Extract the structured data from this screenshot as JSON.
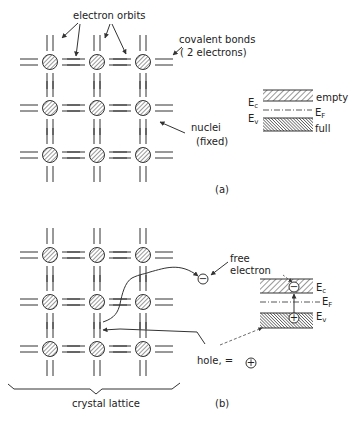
{
  "figure": {
    "panel_a": {
      "caption": "(a)",
      "labels": {
        "electron_orbits": "electron orbits",
        "covalent_bonds_line1": "covalent bonds",
        "covalent_bonds_line2": "( 2 electrons)",
        "nuclei_line1": "nuclei",
        "nuclei_line2": "(fixed)"
      },
      "band_diagram": {
        "conduction_label": "E",
        "conduction_sub": "c",
        "valence_label": "E",
        "valence_sub": "v",
        "fermi_label": "E",
        "fermi_sub": "F",
        "conduction_state": "empty",
        "valence_state": "full"
      },
      "lattice": {
        "rows": 3,
        "cols": 3
      }
    },
    "panel_b": {
      "caption": "(b)",
      "labels": {
        "free_electron_line1": "free",
        "free_electron_line2": "electron",
        "hole": "hole, =",
        "crystal_lattice": "crystal lattice",
        "minus_sign": "−",
        "plus_sign": "+"
      },
      "band_diagram": {
        "conduction_label": "E",
        "conduction_sub": "c",
        "valence_label": "E",
        "valence_sub": "v",
        "fermi_label": "E",
        "fermi_sub": "F"
      },
      "lattice": {
        "rows": 3,
        "cols": 3
      }
    }
  }
}
